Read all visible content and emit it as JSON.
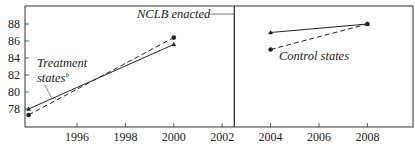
{
  "chart_data": {
    "type": "line",
    "title": "",
    "xlabel": "",
    "ylabel": "",
    "ylim": [
      76,
      89.5
    ],
    "xlim": [
      1993.8,
      2009.8
    ],
    "y_ticks": [
      78,
      80,
      82,
      84,
      86,
      88
    ],
    "x_ticks": [
      1996,
      1998,
      2000,
      2002,
      2004,
      2006,
      2008
    ],
    "grid": false,
    "legend": null,
    "vertical_line": {
      "x": 2002.5,
      "label": "NCLB enacted"
    },
    "panels": [
      {
        "name": "Treatment states",
        "series": [
          {
            "name": "Treatment states (solid, triangles)",
            "style": "solid",
            "marker": "triangle",
            "x": [
              1994,
              2000
            ],
            "values": [
              78.0,
              85.6
            ]
          },
          {
            "name": "Treatment states (dashed, circles)",
            "style": "dashed",
            "marker": "circle",
            "x": [
              1994,
              2000
            ],
            "values": [
              77.3,
              86.4
            ]
          }
        ]
      },
      {
        "name": "Control states",
        "series": [
          {
            "name": "Control states (solid, triangles)",
            "style": "solid",
            "marker": "triangle",
            "x": [
              2004,
              2008
            ],
            "values": [
              87.0,
              88.0
            ]
          },
          {
            "name": "Control states (dashed, circles)",
            "style": "dashed",
            "marker": "circle",
            "x": [
              2004,
              2008
            ],
            "values": [
              85.0,
              88.0
            ]
          }
        ]
      }
    ],
    "annotations": [
      {
        "text": "Treatment states",
        "superscript": "b"
      },
      {
        "text": "Control states"
      },
      {
        "text": "NCLB enacted"
      }
    ]
  },
  "labels": {
    "nclb": "NCLB enacted",
    "treatment_line1": "Treatment",
    "treatment_line2": "states",
    "treatment_sup": "b",
    "control": "Control states"
  },
  "colors": {
    "line": "#222222",
    "axis": "#333333"
  }
}
